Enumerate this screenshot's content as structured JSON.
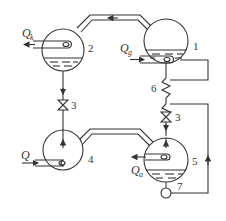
{
  "diagram": {
    "type": "absorption-refrigeration-schematic",
    "components": [
      {
        "id": "1",
        "label": "1",
        "role": "generator"
      },
      {
        "id": "2",
        "label": "2",
        "role": "condenser"
      },
      {
        "id": "3a",
        "label": "3",
        "role": "expansion-valve-left"
      },
      {
        "id": "3b",
        "label": "3",
        "role": "expansion-valve-right"
      },
      {
        "id": "4",
        "label": "4",
        "role": "evaporator"
      },
      {
        "id": "5",
        "label": "5",
        "role": "absorber"
      },
      {
        "id": "6",
        "label": "6",
        "role": "heat-exchanger"
      },
      {
        "id": "7",
        "label": "7",
        "role": "pump"
      }
    ],
    "heat_flows": [
      {
        "symbol": "Q",
        "subscript": "k",
        "at": "2",
        "direction": "out"
      },
      {
        "symbol": "Q",
        "subscript": "g",
        "at": "1",
        "direction": "in"
      },
      {
        "symbol": "Q",
        "subscript": "",
        "at": "4",
        "direction": "in"
      },
      {
        "symbol": "Q",
        "subscript": "a",
        "at": "5",
        "direction": "out"
      }
    ]
  },
  "labels": {
    "n1": "1",
    "n2": "2",
    "n3a": "3",
    "n3b": "3",
    "n4": "4",
    "n5": "5",
    "n6": "6",
    "n7": "7",
    "qk": "Q",
    "qk_sub": "k",
    "qg": "Q",
    "qg_sub": "g",
    "q": "Q",
    "qa": "Q",
    "qa_sub": "a"
  },
  "colors": {
    "line": "#333333",
    "background": "#ffffff"
  }
}
